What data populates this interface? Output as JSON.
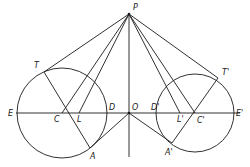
{
  "figure": {
    "points": {
      "P": {
        "label": "P",
        "x": 129,
        "y": 14,
        "lx": 133,
        "ly": 10
      },
      "O": {
        "label": "O",
        "x": 129,
        "y": 113,
        "lx": 132,
        "ly": 110
      },
      "T": {
        "label": "T",
        "x": 44,
        "y": 72,
        "lx": 34,
        "ly": 68
      },
      "T2": {
        "label": "T'",
        "x": 218,
        "y": 78,
        "lx": 222,
        "ly": 75
      },
      "C": {
        "label": "C",
        "x": 62,
        "y": 113,
        "lx": 54,
        "ly": 122
      },
      "C2": {
        "label": "C'",
        "x": 195,
        "y": 113,
        "lx": 197,
        "ly": 123
      },
      "L": {
        "label": "L",
        "x": 79,
        "y": 113,
        "lx": 77,
        "ly": 122
      },
      "L2": {
        "label": "L'",
        "x": 180,
        "y": 113,
        "lx": 177,
        "ly": 122
      },
      "D": {
        "label": "D",
        "x": 107,
        "y": 113,
        "lx": 109,
        "ly": 110
      },
      "D2": {
        "label": "D'",
        "x": 156,
        "y": 113,
        "lx": 151,
        "ly": 110
      },
      "E": {
        "label": "E",
        "x": 17,
        "y": 113,
        "lx": 8,
        "ly": 116
      },
      "E2": {
        "label": "E'",
        "x": 234,
        "y": 113,
        "lx": 236,
        "ly": 116
      },
      "A": {
        "label": "A",
        "x": 90,
        "y": 148,
        "lx": 90,
        "ly": 159
      },
      "A2": {
        "label": "A'",
        "x": 172,
        "y": 143,
        "lx": 165,
        "ly": 155
      }
    },
    "circles": [
      {
        "name": "left-circle",
        "cx": 62,
        "cy": 113,
        "r": 45
      },
      {
        "name": "right-circle",
        "cx": 195,
        "cy": 113,
        "r": 39
      }
    ]
  }
}
